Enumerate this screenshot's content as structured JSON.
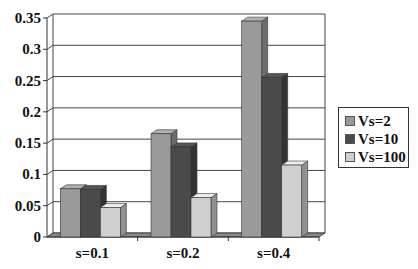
{
  "chart_data": {
    "type": "bar",
    "style": "3d-clustered-column",
    "title": "",
    "xlabel": "",
    "ylabel": "",
    "categories": [
      "s=0.1",
      "s=0.2",
      "s=0.4"
    ],
    "series": [
      {
        "name": "Vs=2",
        "color": "#9a9a9a",
        "values": [
          0.077,
          0.165,
          0.345
        ]
      },
      {
        "name": "Vs=10",
        "color": "#4a4a4a",
        "values": [
          0.076,
          0.144,
          0.255
        ]
      },
      {
        "name": "Vs=100",
        "color": "#cfcfcf",
        "values": [
          0.047,
          0.063,
          0.115
        ]
      }
    ],
    "ylim": [
      0,
      0.35
    ],
    "yticks": [
      "0",
      "0.05",
      "0.1",
      "0.15",
      "0.2",
      "0.25",
      "0.3",
      "0.35"
    ],
    "grid": true,
    "legend_position": "right"
  }
}
